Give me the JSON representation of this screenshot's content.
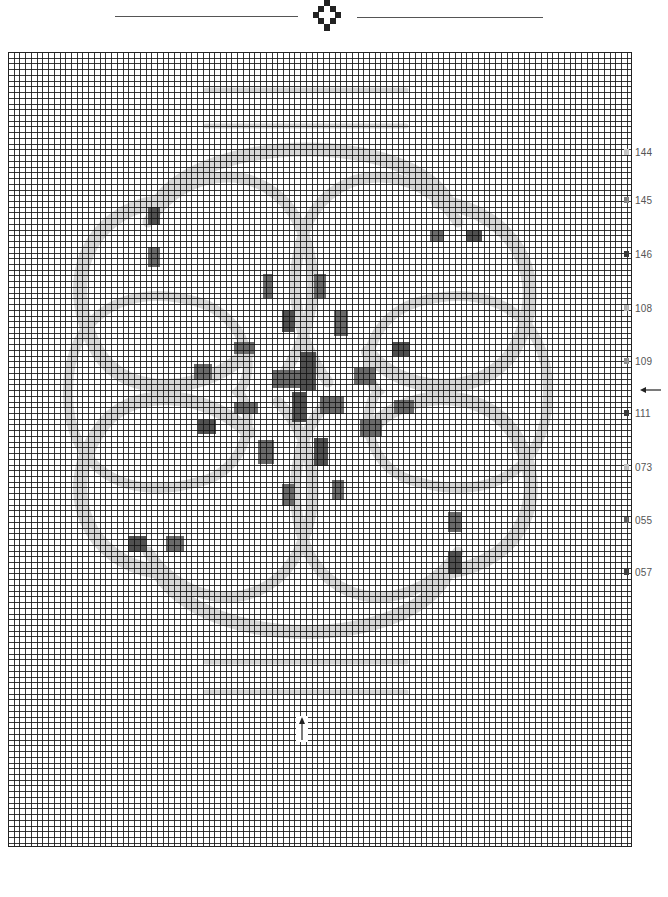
{
  "header": {
    "ornament": "diamond-cross-ornament"
  },
  "chart": {
    "type": "cross-stitch-pattern",
    "grid": {
      "columns": 109,
      "rows": 139,
      "cell_px": 5.73
    },
    "colors": {
      "band": "#d6d6d6",
      "dark": "#6a6a6a",
      "darker": "#505050",
      "grid_line": "#1a1a1a"
    },
    "bands": [
      {
        "id": "top-bar-1",
        "d": "M198 38 L398 38",
        "w": 5
      },
      {
        "id": "top-bar-2",
        "d": "M198 74 L398 74",
        "w": 5
      },
      {
        "id": "bottom-bar-1",
        "d": "M198 610 L398 610",
        "w": 5
      },
      {
        "id": "bottom-bar-2",
        "d": "M198 640 L398 640",
        "w": 5
      },
      {
        "id": "outer-loop-top-left",
        "d": "M150 150 C 80 160, 50 230, 90 300 C 120 350, 200 340, 240 300",
        "w": 14
      },
      {
        "id": "outer-loop-top-right",
        "d": "M430 150 C 510 160, 545 230, 505 300 C 470 350, 390 340, 360 300",
        "w": 14
      },
      {
        "id": "outer-loop-bottom-left",
        "d": "M150 520 C 80 510, 50 440, 90 380 C 120 330, 200 340, 240 380",
        "w": 14
      },
      {
        "id": "outer-loop-bottom-right",
        "d": "M440 520 C 515 510, 545 440, 505 380 C 470 330, 390 340, 360 380",
        "w": 14
      },
      {
        "id": "big-arc-top",
        "d": "M150 150 C 200 80, 400 80, 440 150",
        "w": 14
      },
      {
        "id": "big-arc-bottom",
        "d": "M150 520 C 200 600, 400 600, 440 520",
        "w": 14
      },
      {
        "id": "inner-arc-top-left",
        "d": "M140 170 C 180 110, 260 110, 290 170 C 320 230, 300 290, 270 330",
        "w": 11
      },
      {
        "id": "inner-arc-top-right",
        "d": "M450 170 C 410 110, 330 110, 300 170 C 275 230, 290 290, 320 330",
        "w": 11
      },
      {
        "id": "inner-arc-bottom-left",
        "d": "M140 500 C 180 560, 260 560, 290 500 C 320 440, 300 380, 270 350",
        "w": 11
      },
      {
        "id": "inner-arc-bottom-right",
        "d": "M450 500 C 410 560, 330 560, 300 500 C 275 440, 290 380, 320 350",
        "w": 11
      },
      {
        "id": "mid-left-loop",
        "d": "M60 340 C 60 260, 120 230, 190 250 C 240 265, 250 320, 230 340 C 250 360, 240 420, 190 430 C 120 450, 60 420, 60 340",
        "w": 10
      },
      {
        "id": "mid-right-loop",
        "d": "M540 340 C 540 260, 480 230, 410 250 C 360 265, 350 320, 370 340 C 350 360, 360 420, 410 430 C 480 450, 540 420, 540 340",
        "w": 10
      }
    ],
    "dark_blocks": [
      {
        "x": 140,
        "y": 155,
        "w": 12,
        "h": 18
      },
      {
        "x": 140,
        "y": 195,
        "w": 12,
        "h": 20
      },
      {
        "x": 422,
        "y": 178,
        "w": 14,
        "h": 12
      },
      {
        "x": 458,
        "y": 178,
        "w": 16,
        "h": 12
      },
      {
        "x": 255,
        "y": 222,
        "w": 10,
        "h": 24
      },
      {
        "x": 306,
        "y": 222,
        "w": 12,
        "h": 24
      },
      {
        "x": 274,
        "y": 258,
        "w": 12,
        "h": 22
      },
      {
        "x": 326,
        "y": 258,
        "w": 14,
        "h": 26
      },
      {
        "x": 226,
        "y": 290,
        "w": 20,
        "h": 12
      },
      {
        "x": 384,
        "y": 290,
        "w": 18,
        "h": 14
      },
      {
        "x": 186,
        "y": 312,
        "w": 18,
        "h": 16
      },
      {
        "x": 264,
        "y": 318,
        "w": 30,
        "h": 18
      },
      {
        "x": 292,
        "y": 300,
        "w": 16,
        "h": 38
      },
      {
        "x": 346,
        "y": 316,
        "w": 22,
        "h": 16
      },
      {
        "x": 226,
        "y": 350,
        "w": 24,
        "h": 12
      },
      {
        "x": 284,
        "y": 340,
        "w": 14,
        "h": 30
      },
      {
        "x": 312,
        "y": 344,
        "w": 24,
        "h": 18
      },
      {
        "x": 386,
        "y": 348,
        "w": 20,
        "h": 14
      },
      {
        "x": 190,
        "y": 368,
        "w": 18,
        "h": 14
      },
      {
        "x": 352,
        "y": 368,
        "w": 22,
        "h": 16
      },
      {
        "x": 250,
        "y": 388,
        "w": 16,
        "h": 24
      },
      {
        "x": 306,
        "y": 386,
        "w": 14,
        "h": 28
      },
      {
        "x": 274,
        "y": 432,
        "w": 12,
        "h": 22
      },
      {
        "x": 324,
        "y": 428,
        "w": 12,
        "h": 20
      },
      {
        "x": 120,
        "y": 484,
        "w": 18,
        "h": 16
      },
      {
        "x": 158,
        "y": 484,
        "w": 18,
        "h": 16
      },
      {
        "x": 440,
        "y": 460,
        "w": 14,
        "h": 20
      },
      {
        "x": 440,
        "y": 500,
        "w": 14,
        "h": 22
      }
    ]
  },
  "legend": {
    "items": [
      {
        "code": "144",
        "swatch": "#c4c4c4",
        "y": 146
      },
      {
        "code": "145",
        "swatch": "#808080",
        "y": 194
      },
      {
        "code": "146",
        "swatch": "#383838",
        "y": 248
      },
      {
        "code": "108",
        "swatch": "#b4b4b4",
        "y": 302
      },
      {
        "code": "109",
        "swatch": "#8e8e8e",
        "y": 355
      },
      {
        "code": "111",
        "swatch": "#3a3a3a",
        "y": 407
      },
      {
        "code": "073",
        "swatch": "#bdbdbd",
        "y": 461
      },
      {
        "code": "055",
        "swatch": "#5c5c5c",
        "y": 514
      },
      {
        "code": "057",
        "swatch": "#404040",
        "y": 566
      }
    ]
  },
  "markers": {
    "row_center_arrow": "left-arrow",
    "column_center_arrow": "up-arrow"
  }
}
